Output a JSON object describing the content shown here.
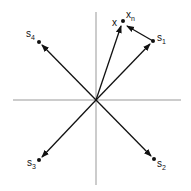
{
  "diagram": {
    "origin": [
      96,
      100
    ],
    "axes": {
      "horizontal": {
        "x1": 13,
        "x2": 181,
        "y": 100
      },
      "vertical": {
        "x": 96,
        "y1": 12,
        "y2": 185
      }
    },
    "points": [
      {
        "id": "s1",
        "label": "s",
        "sub": "1",
        "x": 153,
        "y": 41,
        "lx": 158,
        "ly": 40
      },
      {
        "id": "s2",
        "label": "s",
        "sub": "2",
        "x": 154,
        "y": 159,
        "lx": 158,
        "ly": 166
      },
      {
        "id": "s3",
        "label": "s",
        "sub": "3",
        "x": 39,
        "y": 160,
        "lx": 27,
        "ly": 167
      },
      {
        "id": "s4",
        "label": "s",
        "sub": "4",
        "x": 39,
        "y": 42,
        "lx": 26,
        "ly": 37
      },
      {
        "id": "xn",
        "label": "x",
        "sub": "n",
        "x": 123,
        "y": 21,
        "lx": 126,
        "ly": 19
      },
      {
        "id": "x",
        "label": "x",
        "sub": "",
        "x": 121,
        "y": 26,
        "lx": 112,
        "ly": 26
      }
    ],
    "colors": {
      "stroke": "#111111",
      "axis": "#999999"
    }
  }
}
